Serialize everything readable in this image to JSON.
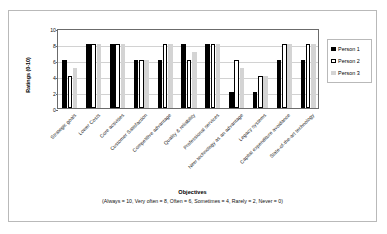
{
  "chart_data": {
    "type": "bar",
    "title": "",
    "xlabel": "Objectives",
    "xlabel_note": "(Always = 10, Very often = 8, Often = 6, Sometimes = 4, Rarely = 2, Never = 0)",
    "ylabel": "Ratings (0-10)",
    "ylim": [
      0,
      10
    ],
    "yticks": [
      0,
      2,
      4,
      6,
      8,
      10
    ],
    "grid": true,
    "legend_position": "right",
    "categories": [
      "Strategic goals",
      "Lower Costs",
      "Core activities",
      "Customer Satisfaction",
      "Competitive advantage",
      "Quality & reliability",
      "Professional services",
      "New technology as an advantage",
      "Legacy systems",
      "Capital expenditure avoidance",
      "State-of-the-art technology"
    ],
    "series": [
      {
        "name": "Person 1",
        "color": "#000000",
        "values": [
          6,
          8,
          8,
          6,
          6,
          8,
          8,
          2,
          2,
          6,
          6
        ]
      },
      {
        "name": "Person 2",
        "color": "#ffffff",
        "values": [
          4,
          8,
          8,
          6,
          8,
          6,
          8,
          6,
          4,
          8,
          8
        ]
      },
      {
        "name": "Person 3",
        "color": "#d4d4d4",
        "values": [
          5,
          8,
          8,
          6,
          8,
          7,
          8,
          5,
          4,
          8,
          8
        ]
      }
    ]
  }
}
